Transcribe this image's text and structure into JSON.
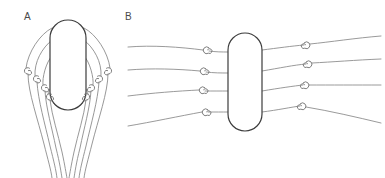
{
  "figure": {
    "background_color": "#ffffff",
    "line_color": "#8c8c8c",
    "outline_color": "#3c3c3c",
    "label_color": "#4a4a4a",
    "panels": [
      {
        "id": "A",
        "label": "A",
        "label_x": 24,
        "label_y": 20,
        "capsule": {
          "x": 50,
          "y": 20,
          "width": 36,
          "height": 90,
          "radius": 18
        },
        "left_loops": [
          {
            "cx": 27,
            "cy": 71
          },
          {
            "cx": 36,
            "cy": 79
          },
          {
            "cx": 44,
            "cy": 88
          },
          {
            "cx": 49,
            "cy": 97
          }
        ],
        "right_loops": [
          {
            "cx": 109,
            "cy": 71
          },
          {
            "cx": 100,
            "cy": 79
          },
          {
            "cx": 92,
            "cy": 88
          },
          {
            "cx": 87,
            "cy": 97
          }
        ]
      },
      {
        "id": "B",
        "label": "B",
        "label_x": 125,
        "label_y": 20,
        "capsule": {
          "x": 228,
          "y": 33,
          "width": 34,
          "height": 98,
          "radius": 17
        },
        "left_loops": [
          {
            "cx": 206,
            "cy": 50
          },
          {
            "cx": 203,
            "cy": 71
          },
          {
            "cx": 202,
            "cy": 90
          },
          {
            "cx": 205,
            "cy": 112
          }
        ],
        "right_loops": [
          {
            "cx": 307,
            "cy": 45
          },
          {
            "cx": 309,
            "cy": 64
          },
          {
            "cx": 306,
            "cy": 85
          },
          {
            "cx": 303,
            "cy": 106
          }
        ]
      }
    ]
  }
}
